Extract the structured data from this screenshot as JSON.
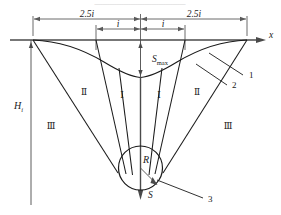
{
  "figure": {
    "title_fragment": "—————————————",
    "axes": {
      "x_axis_label": "x",
      "s_axis_label": "S"
    },
    "dimensions": {
      "left_outer": "2.5i",
      "left_inner": "i",
      "right_inner": "i",
      "right_outer": "2.5i"
    },
    "measures": {
      "depth_label": "H",
      "depth_subscript": "i",
      "max_subsidence_label": "S",
      "max_subsidence_subscript": "max",
      "radius_label": "R"
    },
    "zones": {
      "inner_left": "Ⅰ",
      "inner_right": "Ⅰ",
      "middle_left": "Ⅱ",
      "middle_right": "Ⅱ",
      "outer_left": "Ⅲ",
      "outer_right": "Ⅲ"
    },
    "callouts": {
      "one": "1",
      "two": "2",
      "three": "3"
    },
    "colors": {
      "line": "#1a1a1a",
      "axis": "#4a4a4a",
      "dimension": "#5a5a5a",
      "background": "#ffffff"
    }
  }
}
